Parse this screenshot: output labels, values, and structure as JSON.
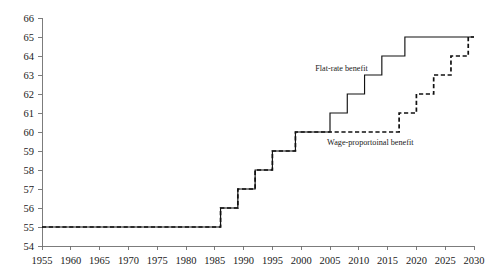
{
  "chart_data": {
    "type": "line",
    "title": "",
    "subtitle": "",
    "xlabel": "",
    "ylabel": "",
    "xlim": [
      1955,
      2030
    ],
    "ylim": [
      54,
      66
    ],
    "grid": false,
    "legend_position": "inline-annotation",
    "x_ticks": [
      1955,
      1960,
      1965,
      1970,
      1975,
      1980,
      1985,
      1990,
      1995,
      2000,
      2005,
      2010,
      2015,
      2020,
      2025,
      2030
    ],
    "y_ticks": [
      54,
      55,
      56,
      57,
      58,
      59,
      60,
      61,
      62,
      63,
      64,
      65,
      66
    ],
    "x_tick_labels": [
      "1955",
      "1960",
      "1965",
      "1970",
      "1975",
      "1980",
      "1985",
      "1990",
      "1995",
      "2000",
      "2005",
      "2010",
      "2015",
      "2020",
      "2025",
      "2030"
    ],
    "y_tick_labels": [
      "54",
      "55",
      "56",
      "57",
      "58",
      "59",
      "60",
      "61",
      "62",
      "63",
      "64",
      "65",
      "66"
    ],
    "series": [
      {
        "name": "Flat-rate benefit",
        "style": "solid",
        "color": "#111111",
        "annotation_x": 2007,
        "annotation_y": 63.2,
        "step_points": [
          [
            1955,
            55
          ],
          [
            1986,
            55
          ],
          [
            1986,
            56
          ],
          [
            1989,
            56
          ],
          [
            1989,
            57
          ],
          [
            1992,
            57
          ],
          [
            1992,
            58
          ],
          [
            1995,
            58
          ],
          [
            1995,
            59
          ],
          [
            1999,
            59
          ],
          [
            1999,
            60
          ],
          [
            2005,
            60
          ],
          [
            2005,
            61
          ],
          [
            2008,
            61
          ],
          [
            2008,
            62
          ],
          [
            2011,
            62
          ],
          [
            2011,
            63
          ],
          [
            2014,
            63
          ],
          [
            2014,
            64
          ],
          [
            2018,
            64
          ],
          [
            2018,
            65
          ],
          [
            2030,
            65
          ]
        ]
      },
      {
        "name": "Wage-proportoinal benefit",
        "style": "dashed",
        "color": "#111111",
        "annotation_x": 2012,
        "annotation_y": 59.3,
        "step_points": [
          [
            1955,
            55
          ],
          [
            1986,
            55
          ],
          [
            1986,
            56
          ],
          [
            1989,
            56
          ],
          [
            1989,
            57
          ],
          [
            1992,
            57
          ],
          [
            1992,
            58
          ],
          [
            1995,
            58
          ],
          [
            1995,
            59
          ],
          [
            1999,
            59
          ],
          [
            1999,
            60
          ],
          [
            2017,
            60
          ],
          [
            2017,
            61
          ],
          [
            2020,
            61
          ],
          [
            2020,
            62
          ],
          [
            2023,
            62
          ],
          [
            2023,
            63
          ],
          [
            2026,
            63
          ],
          [
            2026,
            64
          ],
          [
            2029,
            64
          ],
          [
            2029,
            65
          ],
          [
            2030,
            65
          ]
        ]
      }
    ]
  }
}
